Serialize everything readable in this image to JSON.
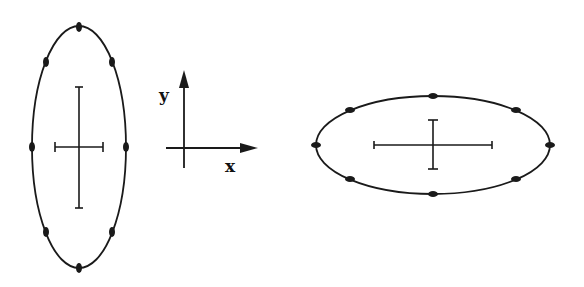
{
  "diagram": {
    "stroke_color": "#1a1a1a",
    "background": "#ffffff",
    "left_ellipse": {
      "orientation": "vertical",
      "center": [
        79,
        147
      ],
      "rx": 47,
      "ry": 121,
      "markers": 8,
      "cross": {
        "h_half": 24,
        "v_half": 60
      }
    },
    "axes": {
      "origin": [
        184,
        148
      ],
      "y_label": "y",
      "x_label": "x"
    },
    "right_ellipse": {
      "orientation": "horizontal",
      "center": [
        433,
        145
      ],
      "rx": 117,
      "ry": 49,
      "markers": 8,
      "cross": {
        "h_half": 59,
        "v_half": 24
      }
    }
  }
}
